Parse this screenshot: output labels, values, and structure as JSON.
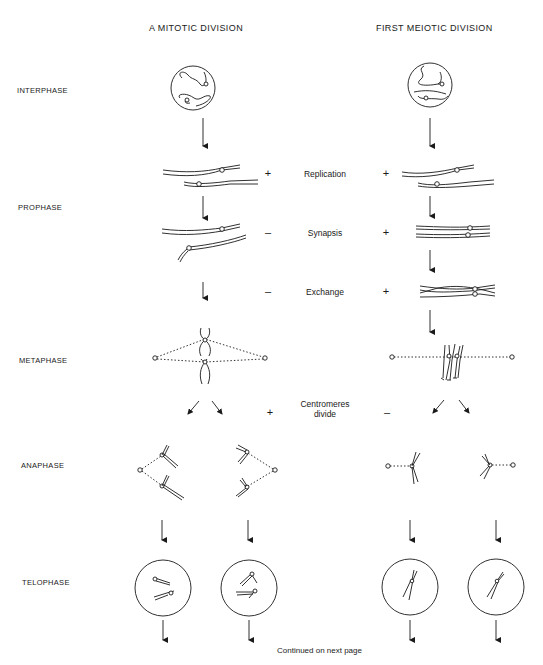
{
  "columns": {
    "mitotic": "A MITOTIC DIVISION",
    "meiotic": "FIRST MEIOTIC DIVISION"
  },
  "stages": [
    {
      "id": "interphase",
      "label": "INTERPHASE"
    },
    {
      "id": "prophase",
      "label": "PROPHASE"
    },
    {
      "id": "metaphase",
      "label": "METAPHASE"
    },
    {
      "id": "anaphase",
      "label": "ANAPHASE"
    },
    {
      "id": "telophase",
      "label": "TELOPHASE"
    }
  ],
  "processes": [
    {
      "id": "replication",
      "label": "Replication",
      "mitotic": "+",
      "meiotic": "+"
    },
    {
      "id": "synapsis",
      "label": "Synapsis",
      "mitotic": "–",
      "meiotic": "+"
    },
    {
      "id": "exchange",
      "label": "Exchange",
      "mitotic": "–",
      "meiotic": "+"
    },
    {
      "id": "centromeres",
      "label_line1": "Centromeres",
      "label_line2": "divide",
      "mitotic": "+",
      "meiotic": "–"
    }
  ],
  "footer": "Continued on next page",
  "colors": {
    "ink": "#1a1a1a",
    "background": "#ffffff"
  }
}
